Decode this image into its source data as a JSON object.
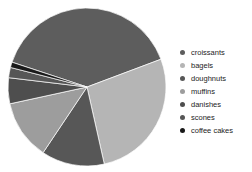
{
  "background_color": "#ffffff",
  "chart_data": {
    "type": "pie",
    "title": "",
    "categories": [
      "croissants",
      "bagels",
      "doughnuts",
      "muffins",
      "danishes",
      "scones",
      "coffee cakes"
    ],
    "values": [
      39.2,
      27.2,
      12.9,
      12.2,
      5.3,
      2.1,
      1.1
    ],
    "values_unit": "percent_estimated_from_slice_angles",
    "colors": [
      "#5d5d5d",
      "#b5b5b5",
      "#575757",
      "#9d9d9d",
      "#4e4e4e",
      "#565656",
      "#191919"
    ],
    "start_angle_deg": 161.7,
    "direction": "clockwise",
    "slice_separator_color": "#ffffff",
    "legend_position": "right",
    "legend_text_color": "#1c1c1c",
    "axes": "none",
    "grid": false
  }
}
